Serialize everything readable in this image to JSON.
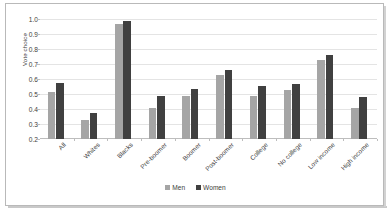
{
  "chart_data": {
    "type": "bar",
    "title": "",
    "xlabel": "",
    "ylabel": "Vote choice",
    "ylim": [
      0.2,
      1.0
    ],
    "yticks": [
      "0.2",
      "0.3",
      "0.4",
      "0.5",
      "0.6",
      "0.7",
      "0.8",
      "0.9",
      "1.0"
    ],
    "grid": true,
    "legend_position": "bottom-center",
    "categories": [
      "All",
      "Whites",
      "Blacks",
      "Pre-boomer",
      "Boomer",
      "Post-boomer",
      "College",
      "No college",
      "Low income",
      "High income"
    ],
    "series": [
      {
        "name": "Men",
        "color": "#a5a5a5",
        "values": [
          0.515,
          0.325,
          0.965,
          0.41,
          0.49,
          0.625,
          0.485,
          0.53,
          0.73,
          0.41
        ]
      },
      {
        "name": "Women",
        "color": "#404040",
        "values": [
          0.575,
          0.375,
          0.985,
          0.49,
          0.535,
          0.66,
          0.555,
          0.57,
          0.76,
          0.48
        ]
      }
    ]
  },
  "legend": {
    "items": [
      {
        "label": "Men"
      },
      {
        "label": "Women"
      }
    ]
  }
}
